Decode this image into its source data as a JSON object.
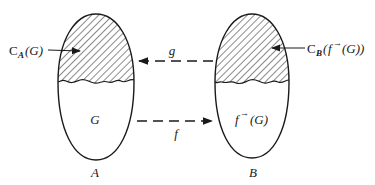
{
  "diagram": {
    "sets": [
      {
        "name": "A",
        "label": "A",
        "inner_label": "G",
        "shaded_label_prefix": "C",
        "shaded_label_sub": "A",
        "shaded_label_arg": "(G)"
      },
      {
        "name": "B",
        "label": "B",
        "inner_label_fn": "f",
        "inner_label_arrow": "→",
        "inner_label_arg": "(G)",
        "shaded_label_prefix": "C",
        "shaded_label_sub": "B",
        "shaded_label_arg_open": "(",
        "shaded_label_fn": "f",
        "shaded_label_arrow": "→",
        "shaded_label_arg_close": "(G))"
      }
    ],
    "arrows": [
      {
        "label": "g",
        "direction": "B to A",
        "style": "dashed"
      },
      {
        "label": "f",
        "direction": "A to B",
        "style": "dashed"
      }
    ],
    "colors": {
      "stroke": "#1a1a1a",
      "background": "#ffffff"
    }
  }
}
